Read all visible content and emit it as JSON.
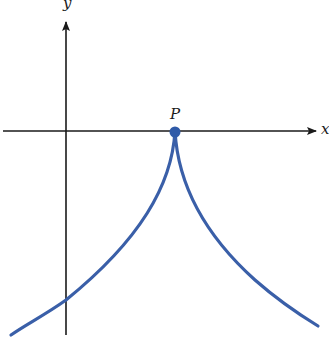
{
  "diagram": {
    "axes": {
      "x_label": "x",
      "y_label": "y",
      "color": "#1a1a1a"
    },
    "point": {
      "label": "P",
      "color": "#2f5aa8"
    },
    "curve": {
      "color": "#3a5fa8",
      "description": "cusp at P opening downward"
    }
  }
}
